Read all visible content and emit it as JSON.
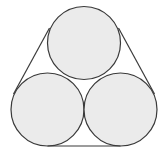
{
  "diagram": {
    "colors": {
      "fill": "#ebebeb",
      "stroke": "#3a3a3a",
      "background": "#ffffff"
    },
    "circles": [
      {
        "id": "top",
        "cx": 84,
        "cy": 43,
        "r": 36.5
      },
      {
        "id": "bottom-left",
        "cx": 47.5,
        "cy": 109.5,
        "r": 36.5
      },
      {
        "id": "bottom-right",
        "cx": 120.5,
        "cy": 109.5,
        "r": 36.5
      }
    ],
    "band_segments": [
      {
        "id": "left",
        "x1": 49.5,
        "y1": 28.0,
        "x2": 13.5,
        "y2": 94.0
      },
      {
        "id": "right",
        "x1": 118.5,
        "y1": 28.0,
        "x2": 154.5,
        "y2": 94.0
      },
      {
        "id": "bottom",
        "x1": 47.5,
        "y1": 146.0,
        "x2": 120.5,
        "y2": 146.0
      }
    ]
  }
}
